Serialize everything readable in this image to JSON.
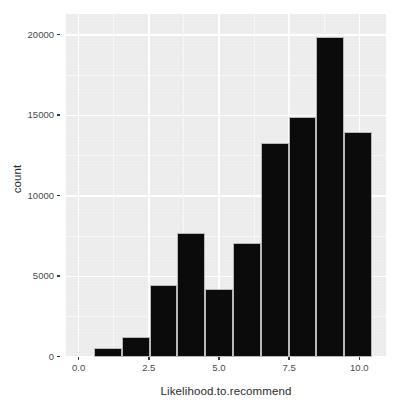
{
  "chart_data": {
    "type": "bar",
    "title": "",
    "subtitle": "",
    "xlabel": "Likelihood.to.recommend",
    "ylabel": "count",
    "xlim": [
      -0.45,
      10.95
    ],
    "ylim": [
      0,
      21300
    ],
    "xticks": [
      "0.0",
      "2.5",
      "5.0",
      "7.5",
      "10.0"
    ],
    "xtick_values": [
      0.0,
      2.5,
      5.0,
      7.5,
      10.0
    ],
    "yticks": [
      "0",
      "5000",
      "10000",
      "15000",
      "20000"
    ],
    "ytick_values": [
      0,
      5000,
      10000,
      15000,
      20000
    ],
    "grid": true,
    "legend": "none",
    "bin_width": 0.99,
    "bins": [
      {
        "x_start": 0.55,
        "x_end": 1.54,
        "center": 1.0,
        "value": 560
      },
      {
        "x_start": 1.54,
        "x_end": 2.53,
        "center": 2.0,
        "value": 1250
      },
      {
        "x_start": 2.53,
        "x_end": 3.52,
        "center": 3.0,
        "value": 4500
      },
      {
        "x_start": 3.52,
        "x_end": 4.51,
        "center": 4.0,
        "value": 7700
      },
      {
        "x_start": 4.51,
        "x_end": 5.5,
        "center": 5.0,
        "value": 4200
      },
      {
        "x_start": 5.5,
        "x_end": 6.49,
        "center": 6.0,
        "value": 7050
      },
      {
        "x_start": 6.49,
        "x_end": 7.48,
        "center": 7.0,
        "value": 13300
      },
      {
        "x_start": 7.48,
        "x_end": 8.47,
        "center": 8.0,
        "value": 14900
      },
      {
        "x_start": 8.47,
        "x_end": 9.46,
        "center": 9.0,
        "value": 19850
      },
      {
        "x_start": 9.46,
        "x_end": 10.45,
        "center": 10.0,
        "value": 13950
      }
    ],
    "categories": [
      "1",
      "2",
      "3",
      "4",
      "5",
      "6",
      "7",
      "8",
      "9",
      "10"
    ],
    "values": [
      560,
      1250,
      4500,
      7700,
      4200,
      7050,
      13300,
      14900,
      19850,
      13950
    ],
    "colors": {
      "bar_fill": "#0b0b0b",
      "bar_border": "#b9b9b9",
      "panel_background": "#ebebeb",
      "grid_major": "#ffffff",
      "grid_minor": "#f6f6f6",
      "axis_text": "#4a4a4a",
      "axis_title": "#2b2b2b",
      "plot_background": "#ffffff"
    }
  }
}
